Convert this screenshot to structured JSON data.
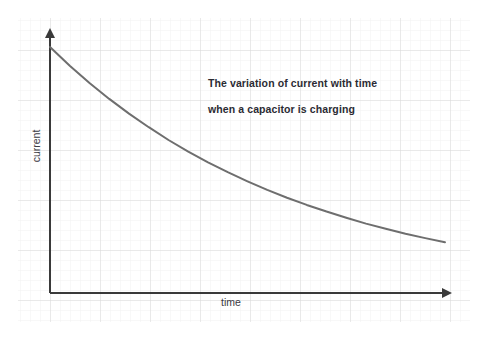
{
  "figure": {
    "background_color": "#ffffff",
    "paper": {
      "name": "graph-paper",
      "minor_grid_color": "#f1f1f1",
      "major_grid_color": "#d9d9d9",
      "minor_spacing_px": 10,
      "major_spacing_px": 50,
      "left": 18,
      "top": 18,
      "right": 470,
      "bottom": 322
    },
    "axis_color": "#3a3a3a",
    "curve_color": "#6e6e6e",
    "title_color": "#2b2b33",
    "label_color": "#3a3a42"
  },
  "title": {
    "line1": "The variation of current with time",
    "line2": "when a capacitor is charging"
  },
  "axes": {
    "x_label": "time",
    "y_label": "current"
  },
  "chart_data": {
    "type": "line",
    "title": "The variation of current with time when a capacitor is charging",
    "xlabel": "time",
    "ylabel": "current",
    "grid": true,
    "legend": null,
    "axis_arrows": true,
    "tick_labels": {
      "x": [],
      "y": []
    },
    "xlim": [
      0,
      1
    ],
    "ylim": [
      0,
      1
    ],
    "equation": "I = I0 * exp(-t / RC)",
    "series": [
      {
        "name": "charging current",
        "color": "#6e6e6e",
        "x": [
          0.0,
          0.05,
          0.1,
          0.15,
          0.2,
          0.25,
          0.3,
          0.35,
          0.4,
          0.45,
          0.5,
          0.55,
          0.6,
          0.65,
          0.7,
          0.75,
          0.8,
          0.85,
          0.9,
          0.95,
          1.0
        ],
        "y": [
          1.0,
          0.924,
          0.854,
          0.789,
          0.729,
          0.674,
          0.622,
          0.575,
          0.531,
          0.491,
          0.454,
          0.419,
          0.387,
          0.358,
          0.331,
          0.306,
          0.282,
          0.261,
          0.241,
          0.223,
          0.206
        ]
      }
    ]
  }
}
